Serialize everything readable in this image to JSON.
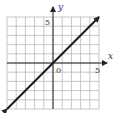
{
  "chart_data": {
    "type": "line",
    "title": "",
    "xlabel": "x",
    "ylabel": "y",
    "xlim": [
      -5,
      5
    ],
    "ylim": [
      -5,
      5
    ],
    "grid": true,
    "grid_step": 1,
    "tick_labels": {
      "x": [
        "0",
        "5"
      ],
      "y": [
        "5"
      ]
    },
    "origin_label": "0",
    "series": [
      {
        "name": "y = x",
        "x": [
          -5,
          5
        ],
        "y": [
          -5,
          5
        ],
        "arrows": "both"
      }
    ],
    "colors": {
      "grid": "#b8b8b8",
      "axis": "#222222",
      "line": "#1a1a1a"
    }
  },
  "labels": {
    "x_axis": "x",
    "y_axis": "y",
    "origin": "0",
    "x_tick_5": "5",
    "y_tick_5": "5"
  }
}
